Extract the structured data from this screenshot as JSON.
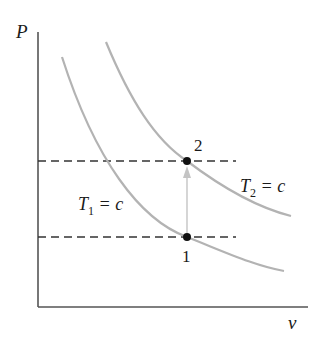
{
  "diagram": {
    "type": "P-v diagram",
    "axes": {
      "y_label": "P",
      "x_label": "v"
    },
    "isotherms": [
      {
        "name": "T1",
        "label_main": "T",
        "label_sub": "1",
        "label_rest": " = c"
      },
      {
        "name": "T2",
        "label_main": "T",
        "label_sub": "2",
        "label_rest": " = c"
      }
    ],
    "states": [
      {
        "id": "1",
        "label": "1"
      },
      {
        "id": "2",
        "label": "2"
      }
    ],
    "process": {
      "from": "1",
      "to": "2",
      "description": "constant-volume heating (arrow from 1 to 2)"
    },
    "colors": {
      "axis": "#555555",
      "curve": "#b3b3b3",
      "dashed": "#333333",
      "arrow": "#c4c4c4",
      "point": "#111111"
    }
  }
}
